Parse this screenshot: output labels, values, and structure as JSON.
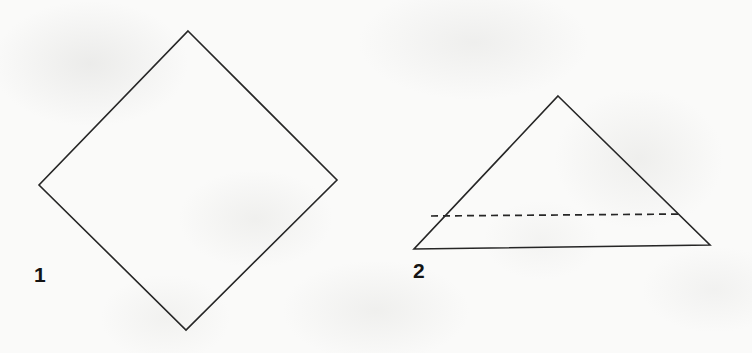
{
  "page": {
    "background_color": "#fafaf9",
    "width": 752,
    "height": 353,
    "stroke_color": "#262626",
    "stroke_width": 1.6
  },
  "figures": [
    {
      "label": "1",
      "name": "diamond",
      "shape": "rhombus",
      "label_position": {
        "x": 34,
        "y": 264
      },
      "stroke": "#262626",
      "line_style": "solid",
      "vertices": [
        {
          "x": 188,
          "y": 31
        },
        {
          "x": 337,
          "y": 180
        },
        {
          "x": 186,
          "y": 330
        },
        {
          "x": 39,
          "y": 185
        }
      ],
      "points": "188,31 337,180 186,330 39,185"
    },
    {
      "label": "2",
      "name": "triangle",
      "shape": "triangle",
      "label_position": {
        "x": 413,
        "y": 260
      },
      "stroke": "#262626",
      "line_style": "solid",
      "vertices": [
        {
          "x": 558,
          "y": 96
        },
        {
          "x": 710,
          "y": 245
        },
        {
          "x": 414,
          "y": 249
        }
      ],
      "points": "558,96 710,245 414,249",
      "interior_line": {
        "name": "dashed-crossline",
        "line_style": "dashed",
        "dash_pattern": "7 5",
        "x1": 431,
        "y1": 216,
        "x2": 683,
        "y2": 214
      }
    }
  ]
}
